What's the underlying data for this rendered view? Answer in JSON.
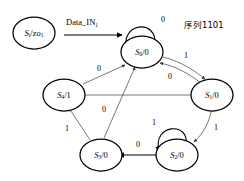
{
  "diagram": {
    "kind": "finite-state-machine",
    "caption": "序列1101",
    "input_signal_label": "Data_IN",
    "input_signal_sub": "1",
    "initial_node": {
      "id": "init",
      "main": "S",
      "main_sub": "i",
      "output": "zo",
      "output_sub": "1",
      "full_label": "S/zo"
    },
    "states": [
      {
        "id": "S0",
        "name": "S",
        "sub": "0",
        "output": "0",
        "label": "S0/0"
      },
      {
        "id": "S1",
        "name": "S",
        "sub": "1",
        "output": "0",
        "label": "S1/0"
      },
      {
        "id": "S2",
        "name": "S",
        "sub": "2",
        "output": "0",
        "label": "S2/0"
      },
      {
        "id": "S3",
        "name": "S",
        "sub": "3",
        "output": "0",
        "label": "S3/0"
      },
      {
        "id": "S4",
        "name": "S",
        "sub": "4",
        "output": "1",
        "label": "S4/1"
      }
    ],
    "transitions": [
      {
        "id": "t-s0-s0",
        "from": "S0",
        "to": "S0",
        "label": "0",
        "kind": "self-loop"
      },
      {
        "id": "t-s0-s1",
        "from": "S0",
        "to": "S1",
        "label": "1",
        "kind": "curve"
      },
      {
        "id": "t-s1-s0",
        "from": "S1",
        "to": "S0",
        "label": "0",
        "kind": "curve"
      },
      {
        "id": "t-s1-s2",
        "from": "S1",
        "to": "S2",
        "label": "1",
        "kind": "line"
      },
      {
        "id": "t-s2-s2",
        "from": "S2",
        "to": "S2",
        "label": "1",
        "kind": "self-loop"
      },
      {
        "id": "t-s2-s3",
        "from": "S2",
        "to": "S3",
        "label": "0",
        "kind": "line"
      },
      {
        "id": "t-s3-s4",
        "from": "S3",
        "to": "S4",
        "label": "1",
        "kind": "line"
      },
      {
        "id": "t-s3-s0",
        "from": "S3",
        "to": "S0",
        "label": "0",
        "kind": "line"
      },
      {
        "id": "t-s4-s0",
        "from": "S4",
        "to": "S0",
        "label": "0",
        "kind": "line"
      },
      {
        "id": "t-s4-s1",
        "from": "S4",
        "to": "S1",
        "label": "",
        "kind": "line"
      }
    ],
    "colors": {
      "background": "#ffffff",
      "node_stroke": "#000000",
      "edge_stroke": "#555555",
      "text": "#000000"
    }
  }
}
